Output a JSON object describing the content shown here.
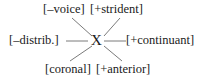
{
  "figure": {
    "type": "feature-geometry-diagram",
    "center_node": "X",
    "background_color": "#ffffff",
    "text_color": "#1a1a1a",
    "line_color": "#6b6b6b",
    "features": {
      "top_left": "[–voice]",
      "top_right": "[+strident]",
      "left": "[–distrib.]",
      "right": "[+continuant]",
      "bottom_left": "[coronal]",
      "bottom_right": "[+anterior]"
    },
    "branches": [
      {
        "name": "branch-top-left",
        "from": [
          92,
          36
        ],
        "to": [
          72,
          18
        ]
      },
      {
        "name": "branch-top-right",
        "from": [
          104,
          36
        ],
        "to": [
          120,
          18
        ]
      },
      {
        "name": "branch-left",
        "from": [
          88,
          41
        ],
        "to": [
          66,
          41
        ]
      },
      {
        "name": "branch-right",
        "from": [
          104,
          41
        ],
        "to": [
          126,
          41
        ]
      },
      {
        "name": "branch-bottom-left",
        "from": [
          92,
          46
        ],
        "to": [
          70,
          61
        ]
      },
      {
        "name": "branch-bottom-right",
        "from": [
          104,
          46
        ],
        "to": [
          122,
          61
        ]
      }
    ]
  }
}
